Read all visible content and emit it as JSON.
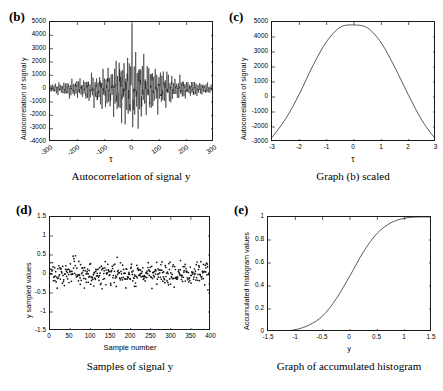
{
  "figure": {
    "background": "#ffffff",
    "line_color": "#303030"
  },
  "panels": {
    "b": {
      "tag": "(b)",
      "caption": "Autocorrelation of signal y",
      "ylabel": "Autocorrelation of signal y",
      "xlabel": "τ",
      "xticks": [
        "-300",
        "-200",
        "-100",
        "0",
        "100",
        "200",
        "300"
      ],
      "yticks": [
        "5000",
        "4000",
        "3000",
        "2000",
        "1000",
        "0",
        "-1000",
        "-2000",
        "-3000",
        "-4000"
      ]
    },
    "c": {
      "tag": "(c)",
      "caption": "Graph (b) scaled",
      "ylabel": "Autocorrelation of signal y",
      "xlabel": "τ",
      "xticks": [
        "-3",
        "-2",
        "-1",
        "0",
        "1",
        "2",
        "3"
      ],
      "yticks": [
        "5000",
        "4000",
        "3000",
        "2000",
        "1000",
        "0",
        "-1000",
        "-2000",
        "-3000"
      ]
    },
    "d": {
      "tag": "(d)",
      "caption": "Samples of signal y",
      "ylabel": "y sampled values",
      "xlabel": "Sample number",
      "xticks": [
        "0",
        "50",
        "100",
        "150",
        "200",
        "250",
        "300",
        "350",
        "400"
      ],
      "yticks": [
        "1.5",
        "1",
        "0.5",
        "0",
        "-0.5",
        "-1",
        "-1.5"
      ]
    },
    "e": {
      "tag": "(e)",
      "caption": "Graph of accumulated histogram",
      "ylabel": "Accumulated histogram values",
      "xlabel": "y",
      "xticks": [
        "-1.5",
        "-1",
        "-0.5",
        "0",
        "0.5",
        "1",
        "1.5"
      ],
      "yticks": [
        "1",
        "0.8",
        "0.6",
        "0.4",
        "0.2",
        "0"
      ]
    }
  },
  "chart_data": [
    {
      "id": "b",
      "type": "line",
      "title": "Autocorrelation of signal y",
      "xlabel": "τ",
      "ylabel": "Autocorrelation of signal y",
      "xlim": [
        -300,
        300
      ],
      "ylim": [
        -4000,
        5000
      ],
      "xticks": [
        -300,
        -200,
        -100,
        0,
        100,
        200,
        300
      ],
      "yticks": [
        -4000,
        -3000,
        -2000,
        -1000,
        0,
        1000,
        2000,
        3000,
        4000,
        5000
      ],
      "grid": false,
      "legend": "none",
      "description": "Noisy oscillating autocorrelation with a tall central spike at tau=0 reaching about 4800 and a deep negative excursion to about -3200; envelope decays from roughly +/-1800 near centre to +/-250 at the edges.",
      "annotations": [
        {
          "label": "central peak",
          "x": 0,
          "y": 4800
        },
        {
          "label": "deepest trough",
          "x": 3,
          "y": -3200
        },
        {
          "label": "envelope at +/-100",
          "y": 1200
        },
        {
          "label": "envelope at +/-250",
          "y": 350
        }
      ]
    },
    {
      "id": "c",
      "type": "line",
      "title": "Graph (b) scaled",
      "xlabel": "τ",
      "ylabel": "Autocorrelation of signal y",
      "xlim": [
        -3,
        3
      ],
      "ylim": [
        -3000,
        5000
      ],
      "xticks": [
        -3,
        -2,
        -1,
        0,
        1,
        2,
        3
      ],
      "yticks": [
        -3000,
        -2000,
        -1000,
        0,
        1000,
        2000,
        3000,
        4000,
        5000
      ],
      "grid": false,
      "legend": "none",
      "description": "Smooth bell-shaped (raised-cosine) curve peaking near 4800 at tau=0 and falling to about -2700 at tau=-3 and -2850 at tau=3.",
      "x": [
        -3,
        -2.5,
        -2,
        -1.5,
        -1,
        -0.5,
        0,
        0.5,
        1,
        1.5,
        2,
        2.5,
        3
      ],
      "y": [
        -2700,
        -1450,
        200,
        2100,
        3700,
        4650,
        4800,
        4600,
        3600,
        1950,
        100,
        -1600,
        -2850
      ]
    },
    {
      "id": "d",
      "type": "scatter",
      "title": "Samples of signal y",
      "xlabel": "Sample number",
      "ylabel": "y sampled values",
      "xlim": [
        0,
        400
      ],
      "ylim": [
        -1.5,
        1.5
      ],
      "xticks": [
        0,
        50,
        100,
        150,
        200,
        250,
        300,
        350,
        400
      ],
      "yticks": [
        -1.5,
        -1,
        -0.5,
        0,
        0.5,
        1,
        1.5
      ],
      "grid": false,
      "legend": "none",
      "n_points": 400,
      "marker": "dot",
      "description": "About 400 scattered sample points spread across sample numbers 0-400, densest between -0.4 and +0.4, with sparse outliers reaching near +1.1 and -1.3."
    },
    {
      "id": "e",
      "type": "line",
      "title": "Graph of accumulated histogram",
      "xlabel": "y",
      "ylabel": "Accumulated histogram values",
      "xlim": [
        -1.5,
        1.5
      ],
      "ylim": [
        0,
        1
      ],
      "xticks": [
        -1.5,
        -1,
        -0.5,
        0,
        0.5,
        1,
        1.5
      ],
      "yticks": [
        0,
        0.2,
        0.4,
        0.6,
        0.8,
        1
      ],
      "grid": false,
      "legend": "none",
      "description": "Monotonic S-shaped cumulative distribution rising from 0 at y=-1.5 through 0.5 at y about 0.02 and saturating at 1.0 by y=1.1.",
      "x": [
        -1.5,
        -1.25,
        -1,
        -0.75,
        -0.5,
        -0.25,
        0,
        0.25,
        0.5,
        0.75,
        1,
        1.25,
        1.5
      ],
      "y": [
        0.0,
        0.005,
        0.02,
        0.06,
        0.14,
        0.29,
        0.49,
        0.7,
        0.86,
        0.95,
        0.99,
        1.0,
        1.0
      ]
    }
  ]
}
